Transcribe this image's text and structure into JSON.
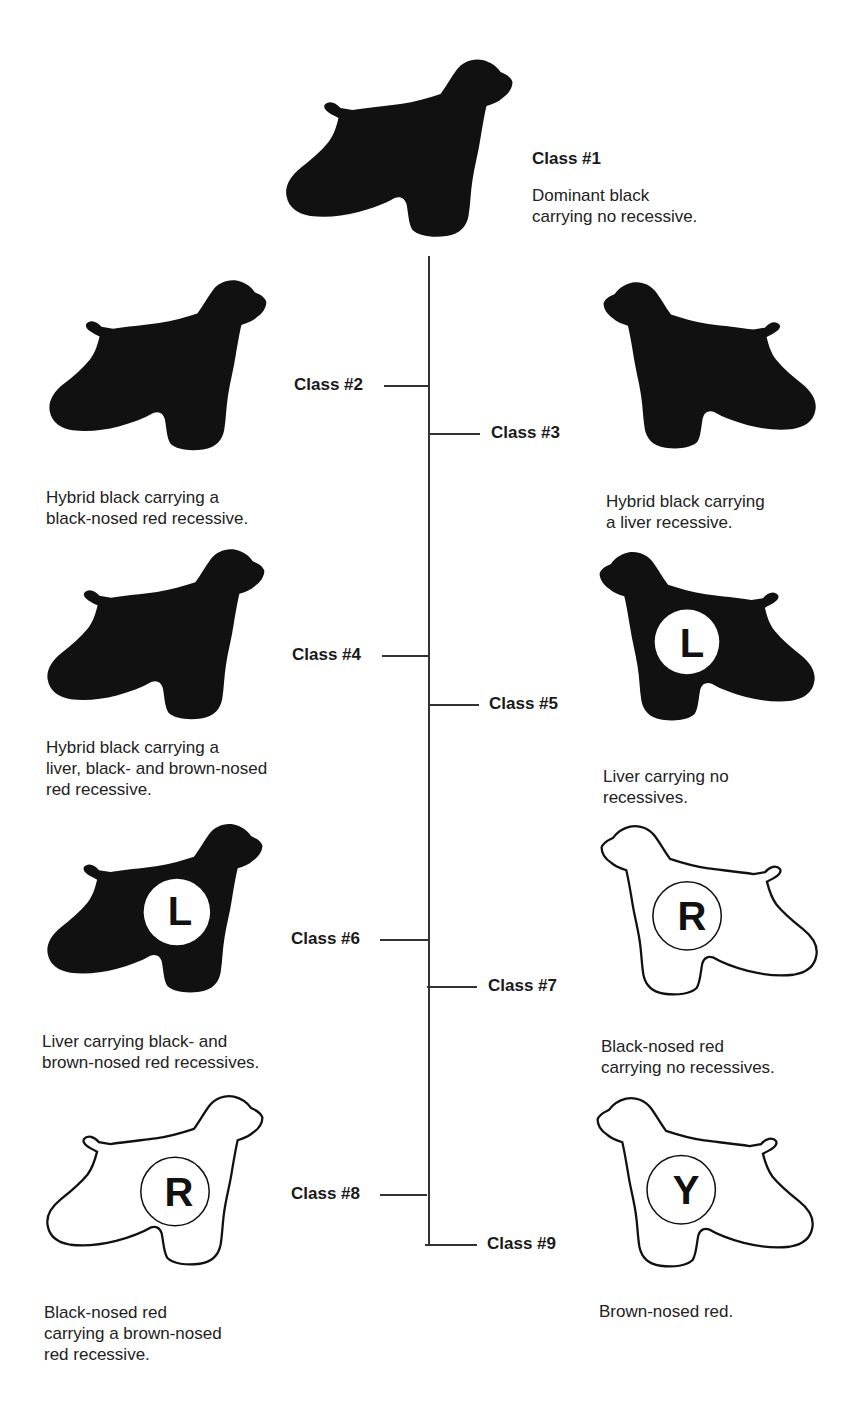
{
  "diagram": {
    "type": "inheritance-classification-tree",
    "connector_color": "#333333",
    "fill_color_black": "#111111",
    "fill_color_outline": "#ffffff",
    "classes": [
      {
        "id": 1,
        "label": "Class #1",
        "description": "Dominant black\ncarrying no recessive.",
        "silhouette": "solid",
        "facing": "right",
        "badge": ""
      },
      {
        "id": 2,
        "label": "Class #2",
        "description": "Hybrid black carrying a\nblack-nosed red recessive.",
        "silhouette": "solid",
        "facing": "right",
        "badge": ""
      },
      {
        "id": 3,
        "label": "Class #3",
        "description": "Hybrid black carrying\na liver recessive.",
        "silhouette": "solid",
        "facing": "left",
        "badge": ""
      },
      {
        "id": 4,
        "label": "Class #4",
        "description": "Hybrid black carrying a\nliver, black- and brown-nosed\nred recessive.",
        "silhouette": "solid",
        "facing": "right",
        "badge": ""
      },
      {
        "id": 5,
        "label": "Class #5",
        "description": "Liver carrying no\nrecessives.",
        "silhouette": "solid",
        "facing": "left",
        "badge": "L"
      },
      {
        "id": 6,
        "label": "Class #6",
        "description": "Liver carrying black- and\nbrown-nosed red recessives.",
        "silhouette": "solid",
        "facing": "right",
        "badge": "L"
      },
      {
        "id": 7,
        "label": "Class #7",
        "description": "Black-nosed red\ncarrying no recessives.",
        "silhouette": "outline",
        "facing": "left",
        "badge": "R"
      },
      {
        "id": 8,
        "label": "Class #8",
        "description": "Black-nosed red\ncarrying a brown-nosed\nred recessive.",
        "silhouette": "outline",
        "facing": "right",
        "badge": "R"
      },
      {
        "id": 9,
        "label": "Class #9",
        "description": "Brown-nosed red.",
        "silhouette": "outline",
        "facing": "left",
        "badge": "Y"
      }
    ]
  }
}
